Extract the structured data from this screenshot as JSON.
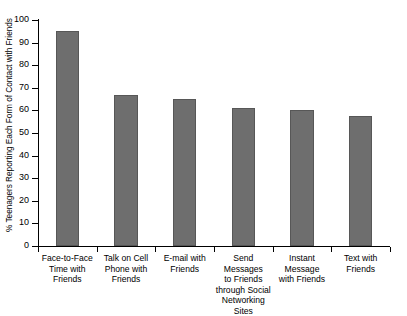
{
  "chart_data": {
    "type": "bar",
    "title": "",
    "subtitle": "",
    "xlabel": "",
    "ylabel": "% Teenagers Reporting Each Form of Contact with Friends",
    "ylim": [
      0,
      100
    ],
    "ytick_step": 10,
    "grid": false,
    "legend": false,
    "bar_color": "#6e6e6e",
    "categories": [
      "Face-to-Face\nTime with\nFriends",
      "Talk on Cell\nPhone with\nFriends",
      "E-mail with\nFriends",
      "Send\nMessages\nto Friends\nthrough Social\nNetworking Sites",
      "Instant\nMessage\nwith Friends",
      "Text with\nFriends"
    ],
    "values": [
      95,
      67,
      65,
      61,
      60,
      57.5
    ],
    "yticks": [
      "0",
      "10",
      "20",
      "30",
      "40",
      "50",
      "60",
      "70",
      "80",
      "90",
      "100"
    ]
  }
}
